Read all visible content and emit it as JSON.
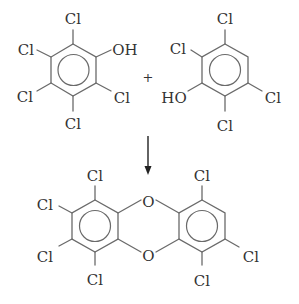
{
  "diagram": {
    "type": "chemical-reaction",
    "reactant1": {
      "name": "pentachlorophenol",
      "labels": {
        "top": "Cl",
        "upper_left": "Cl",
        "upper_right": "OH",
        "lower_left": "Cl",
        "lower_right": "Cl",
        "bottom": "Cl"
      }
    },
    "operator": "+",
    "reactant2": {
      "name": "2,3,5,6-tetrachlorophenol",
      "labels": {
        "top": "Cl",
        "upper_left": "Cl",
        "lower_left": "HO",
        "lower_right": "Cl",
        "bottom": "Cl"
      }
    },
    "arrow": "down",
    "product": {
      "name": "heptachlorodibenzo-p-dioxin",
      "bridge_top": "O",
      "bridge_bottom": "O",
      "left_ring_labels": {
        "top": "Cl",
        "upper_left": "Cl",
        "lower_left": "Cl",
        "bottom": "Cl"
      },
      "right_ring_labels": {
        "top": "Cl",
        "lower_right": "Cl",
        "bottom": "Cl"
      }
    }
  }
}
